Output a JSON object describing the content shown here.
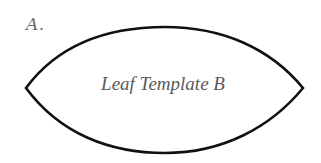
{
  "figure": {
    "label": "A.",
    "title": "Leaf Template B"
  },
  "shape": {
    "type": "leaf-outline",
    "stroke_color": "#111111",
    "fill_color": "#ffffff",
    "left_tip": [
      26,
      88
    ],
    "right_tip": [
      303,
      88
    ],
    "top_apex": [
      165,
      27
    ],
    "bottom_apex": [
      165,
      153
    ]
  }
}
